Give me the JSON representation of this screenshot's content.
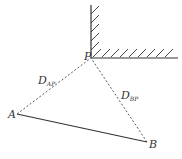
{
  "diagram": {
    "points": {
      "P": {
        "label": "P",
        "x": 91,
        "y": 58
      },
      "A": {
        "label": "A",
        "x": 17,
        "y": 114
      },
      "B": {
        "label": "B",
        "x": 147,
        "y": 142
      }
    },
    "edges": [
      {
        "from": "A",
        "to": "P",
        "style": "dashed",
        "label": "D",
        "subscript": "AP"
      },
      {
        "from": "B",
        "to": "P",
        "style": "dashed",
        "label": "D",
        "subscript": "BP"
      },
      {
        "from": "A",
        "to": "B",
        "style": "solid"
      }
    ],
    "wall": {
      "type": "hatched-corner",
      "corner": "P"
    },
    "colors": {
      "line": "#333333",
      "background": "#ffffff"
    }
  }
}
